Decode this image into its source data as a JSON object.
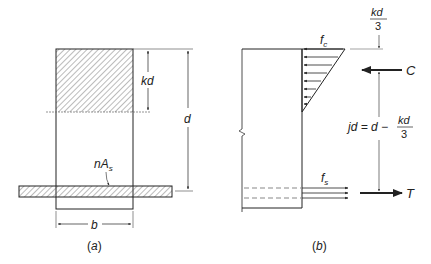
{
  "figure": {
    "panel_a": {
      "caption_open": "(",
      "caption_letter": "a",
      "caption_close": ")",
      "labels": {
        "kd": "kd",
        "d": "d",
        "nAs_main": "nA",
        "nAs_sub": "s",
        "b": "b"
      }
    },
    "panel_b": {
      "caption_open": "(",
      "caption_letter": "b",
      "caption_close": ")",
      "labels": {
        "fc_main": "f",
        "fc_sub": "c",
        "fs_main": "f",
        "fs_sub": "s",
        "C": "C",
        "T": "T",
        "kd3_num": "kd",
        "kd3_den": "3",
        "jd_lhs": "jd = d −",
        "jd_num": "kd",
        "jd_den": "3"
      }
    },
    "colors": {
      "line": "#222222",
      "hatch": "#444444"
    }
  }
}
